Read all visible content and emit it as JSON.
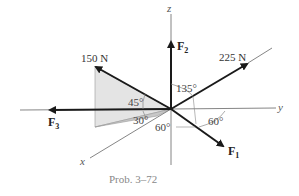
{
  "diagram": {
    "caption": "Prob. 3–72",
    "axes": {
      "x": "x",
      "y": "y",
      "z": "z"
    },
    "forces": [
      {
        "id": "F1",
        "label": "F",
        "sub": "1",
        "magnitude": ""
      },
      {
        "id": "F2",
        "label": "F",
        "sub": "2",
        "magnitude": ""
      },
      {
        "id": "F3",
        "label": "F",
        "sub": "3",
        "magnitude": ""
      },
      {
        "id": "F150",
        "label": "",
        "sub": "",
        "magnitude": "150 N"
      },
      {
        "id": "F225",
        "label": "",
        "sub": "",
        "magnitude": "225 N"
      }
    ],
    "angles": {
      "a135": "135°",
      "a45": "45°",
      "a30": "30°",
      "a60_left": "60°",
      "a60_right": "60°"
    },
    "colors": {
      "arrow": "#1a1a1a",
      "axis": "#777777",
      "shade_light": "#e4e4e4",
      "shade_dark": "#c8c8c8"
    }
  }
}
